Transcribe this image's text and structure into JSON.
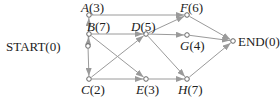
{
  "nodes": [
    {
      "id": "start",
      "name": "START",
      "value": "(0)",
      "x": 88,
      "y": 46
    },
    {
      "id": "a",
      "name": "A",
      "value": "(3)",
      "x": 89,
      "y": 15
    },
    {
      "id": "b",
      "name": "B",
      "value": "(7)",
      "x": 89,
      "y": 34
    },
    {
      "id": "c",
      "name": "C",
      "value": "(2)",
      "x": 89,
      "y": 79
    },
    {
      "id": "d",
      "name": "D",
      "value": "(5)",
      "x": 146,
      "y": 34
    },
    {
      "id": "e",
      "name": "E",
      "value": "(3)",
      "x": 146,
      "y": 79
    },
    {
      "id": "f",
      "name": "F",
      "value": "(6)",
      "x": 187,
      "y": 15
    },
    {
      "id": "g",
      "name": "G",
      "value": "(4)",
      "x": 187,
      "y": 35
    },
    {
      "id": "h",
      "name": "H",
      "value": "(7)",
      "x": 187,
      "y": 79
    },
    {
      "id": "end",
      "name": "END",
      "value": "(0)",
      "x": 233,
      "y": 41
    }
  ],
  "edges": [
    [
      "start",
      "a"
    ],
    [
      "start",
      "b"
    ],
    [
      "start",
      "c"
    ],
    [
      "a",
      "f"
    ],
    [
      "b",
      "d"
    ],
    [
      "b",
      "e"
    ],
    [
      "c",
      "d"
    ],
    [
      "c",
      "e"
    ],
    [
      "d",
      "f"
    ],
    [
      "d",
      "g"
    ],
    [
      "d",
      "h"
    ],
    [
      "e",
      "h"
    ],
    [
      "f",
      "end"
    ],
    [
      "g",
      "end"
    ],
    [
      "h",
      "end"
    ]
  ],
  "colors": {
    "edge": "#9a9a9a",
    "node": "#555555",
    "text": "#222222"
  }
}
